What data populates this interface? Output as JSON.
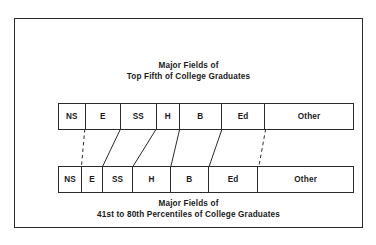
{
  "figure": {
    "top_caption": {
      "line1": "Major Fields of",
      "line2": "Top Fifth of College Graduates"
    },
    "bottom_caption": {
      "line1": "Major Fields of",
      "line2": "41st to 80th Percentiles of College Graduates"
    },
    "border_color": "#2b2b2b",
    "background_color": "#ffffff"
  },
  "chart_data": {
    "type": "bar",
    "xlabel": "",
    "ylabel": "",
    "orientation": "horizontal-stacked",
    "grid": false,
    "legend": "none",
    "categories": [
      "NS",
      "E",
      "SS",
      "H",
      "B",
      "Ed",
      "Other"
    ],
    "series": [
      {
        "name": "Top Fifth of College Graduates",
        "labels": [
          "NS",
          "E",
          "SS",
          "H",
          "B",
          "Ed",
          "Other"
        ],
        "values": [
          8.1,
          10.8,
          10.8,
          7.1,
          12.8,
          13.2,
          26.7
        ],
        "unit": "percent"
      },
      {
        "name": "41st to 80th Percentiles of College Graduates",
        "labels": [
          "NS",
          "E",
          "SS",
          "H",
          "B",
          "Ed",
          "Other"
        ],
        "values": [
          6.8,
          6.1,
          8.8,
          11.1,
          11.1,
          14.5,
          27.7
        ],
        "unit": "percent"
      }
    ],
    "connectors": [
      {
        "from": "NS",
        "style": "dashed"
      },
      {
        "from": "E",
        "style": "solid"
      },
      {
        "from": "SS",
        "style": "solid"
      },
      {
        "from": "H",
        "style": "solid"
      },
      {
        "from": "B",
        "style": "solid"
      },
      {
        "from": "Ed",
        "style": "dashed"
      }
    ],
    "abbreviations": {
      "NS": "NS",
      "E": "E",
      "SS": "SS",
      "H": "H",
      "B": "B",
      "Ed": "Ed",
      "Other": "Other"
    }
  }
}
